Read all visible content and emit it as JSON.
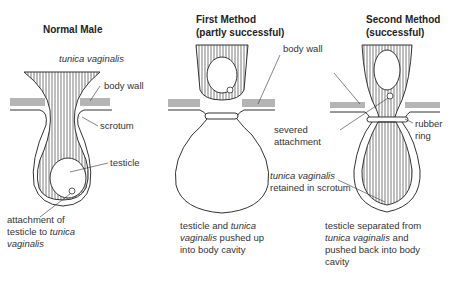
{
  "panels": [
    {
      "title": "Normal Male",
      "labels": {
        "tunica": "tunica vaginalis",
        "body_wall": "body wall",
        "scrotum": "scrotum",
        "testicle": "testicle",
        "attachment_1": "attachment of",
        "attachment_2a": "testicle to ",
        "attachment_2b": "tunica",
        "attachment_3": "vaginalis"
      }
    },
    {
      "title_1": "First Method",
      "title_2": "(partly successful)",
      "labels": {
        "body_wall": "body wall",
        "caption_1a": "testicle and ",
        "caption_1b": "tunica",
        "caption_2a": "vaginalis",
        "caption_2b": " pushed up",
        "caption_3": "into body cavity"
      }
    },
    {
      "title_1": "Second Method",
      "title_2": "(successful)",
      "labels": {
        "severed_1": "severed",
        "severed_2": "attachment",
        "rubber_1": "rubber",
        "rubber_2": "ring",
        "tunica_1": "tunica vaginalis",
        "tunica_2": "retained in scrotum",
        "caption_1": "testicle separated from",
        "caption_2a": "tunica vaginalis",
        "caption_2b": " and",
        "caption_3": "pushed back into body",
        "caption_4": "cavity"
      }
    }
  ],
  "colors": {
    "line": "#333333",
    "text": "#333333",
    "background": "#ffffff"
  }
}
